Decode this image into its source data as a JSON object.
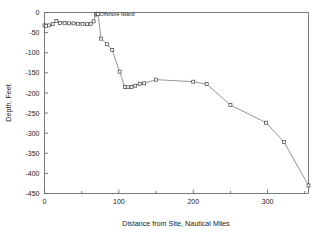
{
  "chart_data": {
    "type": "line",
    "title": "",
    "subtitle": "",
    "xlabel": "Distance from Site, Nautical Miles",
    "ylabel": "Depth, Feet",
    "xlim": [
      0,
      355
    ],
    "ylim": [
      -450,
      0
    ],
    "grid": false,
    "legend": null,
    "xticks": [
      0,
      100,
      200,
      300
    ],
    "xtick_labels": [
      "0",
      "100",
      "200",
      "300"
    ],
    "xminor_ticks": [
      50,
      150,
      250,
      350
    ],
    "yticks": [
      0,
      -50,
      -100,
      -150,
      -200,
      -250,
      -300,
      -350,
      -400,
      -450
    ],
    "ytick_labels": [
      "0",
      "-50",
      "-100",
      "-150",
      "-200",
      "-250",
      "-300",
      "-350",
      "-400",
      "-450"
    ],
    "marker": "square",
    "series": [
      {
        "name": "Bathymetric profile",
        "x": [
          0,
          2,
          6,
          11,
          16,
          21,
          27,
          33,
          39,
          45,
          51,
          57,
          62,
          66,
          69,
          71,
          72,
          76,
          84,
          91,
          101,
          108,
          112,
          117,
          122,
          128,
          134,
          150,
          200,
          218,
          250,
          298,
          322,
          355
        ],
        "values": [
          -32,
          -33,
          -32,
          -29,
          -21,
          -26,
          -26,
          -27,
          -27,
          -28,
          -28,
          -29,
          -28,
          -22,
          -5,
          -3,
          -4,
          -65,
          -79,
          -93,
          -147,
          -185,
          -186,
          -185,
          -182,
          -177,
          -176,
          -167,
          -172,
          -178,
          -230,
          -274,
          -322,
          -430
        ]
      }
    ],
    "annotations": [
      {
        "text": "Offshore Island",
        "x": 74,
        "y": -8,
        "anchor": "start"
      }
    ]
  },
  "axis": {
    "x_title": "Distance from Site, Nautical Miles",
    "y_title": "Depth, Feet"
  }
}
